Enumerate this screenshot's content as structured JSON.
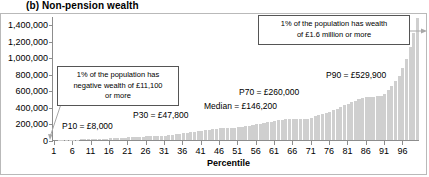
{
  "chart_data": {
    "type": "bar",
    "title": "(b) Non-pension wealth",
    "xlabel": "Percentile",
    "ylabel": "",
    "ylim": [
      0,
      1500000
    ],
    "xlim": [
      1,
      100
    ],
    "grid": false,
    "legend": null,
    "y_ticks": [
      "0",
      "200,000",
      "400,000",
      "600,000",
      "800,000",
      "1,000,000",
      "1,200,000",
      "1,400,000"
    ],
    "y_tick_values": [
      0,
      200000,
      400000,
      600000,
      800000,
      1000000,
      1200000,
      1400000
    ],
    "x_ticks": [
      "1",
      "6",
      "11",
      "16",
      "21",
      "26",
      "31",
      "36",
      "41",
      "46",
      "51",
      "56",
      "61",
      "66",
      "71",
      "76",
      "81",
      "86",
      "91",
      "96"
    ],
    "x_tick_values": [
      1,
      6,
      11,
      16,
      21,
      26,
      31,
      36,
      41,
      46,
      51,
      56,
      61,
      66,
      71,
      76,
      81,
      86,
      91,
      96
    ],
    "categories": [
      1,
      2,
      3,
      4,
      5,
      6,
      7,
      8,
      9,
      10,
      11,
      12,
      13,
      14,
      15,
      16,
      17,
      18,
      19,
      20,
      21,
      22,
      23,
      24,
      25,
      26,
      27,
      28,
      29,
      30,
      31,
      32,
      33,
      34,
      35,
      36,
      37,
      38,
      39,
      40,
      41,
      42,
      43,
      44,
      45,
      46,
      47,
      48,
      49,
      50,
      51,
      52,
      53,
      54,
      55,
      56,
      57,
      58,
      59,
      60,
      61,
      62,
      63,
      64,
      65,
      66,
      67,
      68,
      69,
      70,
      71,
      72,
      73,
      74,
      75,
      76,
      77,
      78,
      79,
      80,
      81,
      82,
      83,
      84,
      85,
      86,
      87,
      88,
      89,
      90,
      91,
      92,
      93,
      94,
      95,
      96,
      97,
      98,
      99,
      100
    ],
    "values": [
      0,
      1000,
      2000,
      3000,
      4000,
      5000,
      6000,
      7000,
      7500,
      8000,
      9500,
      11000,
      13000,
      15000,
      17500,
      20000,
      22500,
      25000,
      27500,
      30000,
      32500,
      35000,
      37500,
      40000,
      42500,
      44000,
      45500,
      46500,
      47200,
      47800,
      52000,
      57000,
      62000,
      68000,
      74000,
      80000,
      86000,
      92000,
      98000,
      104000,
      110000,
      116000,
      122000,
      128000,
      134000,
      140000,
      143000,
      144500,
      145500,
      146200,
      152000,
      159000,
      166000,
      173000,
      180000,
      188000,
      196000,
      204000,
      212000,
      220000,
      229000,
      238000,
      247000,
      253000,
      256000,
      258000,
      259000,
      259500,
      260000,
      260000,
      272000,
      285000,
      299000,
      313000,
      328000,
      344000,
      361000,
      379000,
      398000,
      418000,
      440000,
      462000,
      478000,
      492000,
      505000,
      515000,
      521000,
      525000,
      528000,
      529900,
      560000,
      600000,
      650000,
      710000,
      780000,
      870000,
      980000,
      1120000,
      1300000,
      1470000
    ],
    "annotations": [
      {
        "name": "p10-label",
        "text": "P10 = £8,000"
      },
      {
        "name": "p30-label",
        "text": "P30 = £47,800"
      },
      {
        "name": "median-label",
        "text": "Median = £146,200"
      },
      {
        "name": "p70-label",
        "text": "P70 = £260,000"
      },
      {
        "name": "p90-label",
        "text": "P90 = £529,900"
      }
    ],
    "callouts": [
      {
        "name": "negative-wealth-callout",
        "line1": "1% of the population has",
        "line2": "negative wealth of £11,100",
        "line3": "or more"
      },
      {
        "name": "top-wealth-callout",
        "line1": "1% of the population has wealth",
        "line2": "of £1.6 million or more",
        "line3": ""
      }
    ],
    "colors": {
      "bar": "#cfcfcf",
      "axis": "#8d8d8d",
      "frame": "#b9b9b9",
      "text": "#000000",
      "callout_border": "#555555",
      "leader": "#a0a0a0"
    }
  }
}
